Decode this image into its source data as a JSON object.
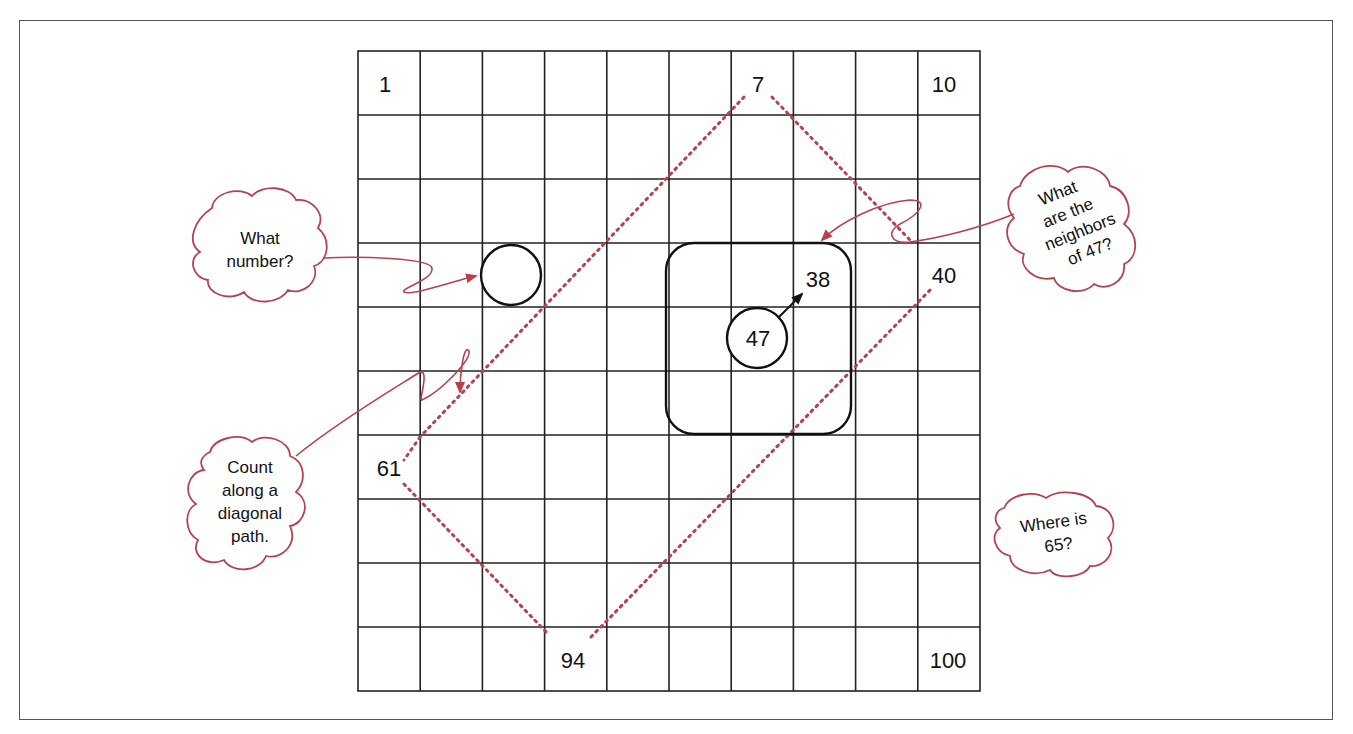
{
  "diagram": {
    "grid": {
      "rows": 10,
      "cols": 10,
      "labeled_cells": [
        {
          "value": "1",
          "row": 0,
          "col": 0
        },
        {
          "value": "7",
          "row": 0,
          "col": 6
        },
        {
          "value": "10",
          "row": 0,
          "col": 9
        },
        {
          "value": "38",
          "row": 3,
          "col": 7
        },
        {
          "value": "40",
          "row": 3,
          "col": 9
        },
        {
          "value": "47",
          "row": 4,
          "col": 6
        },
        {
          "value": "61",
          "row": 6,
          "col": 0
        },
        {
          "value": "94",
          "row": 9,
          "col": 3
        },
        {
          "value": "100",
          "row": 9,
          "col": 9
        }
      ],
      "circled_blank_cell": {
        "row": 3,
        "col": 2
      },
      "neighbors_box": {
        "rows": [
          3,
          5
        ],
        "cols": [
          5,
          7
        ]
      }
    },
    "callouts": {
      "what_number": [
        "What",
        "number?"
      ],
      "count_diagonal": [
        "Count",
        "along a",
        "diagonal",
        "path."
      ],
      "neighbors": [
        "What",
        "are the",
        "neighbors",
        "of 47?"
      ],
      "where_65": [
        "Where is",
        "65?"
      ]
    },
    "colors": {
      "grid_line": "#222222",
      "accent": "#b5434f",
      "frame": "#555555"
    }
  }
}
